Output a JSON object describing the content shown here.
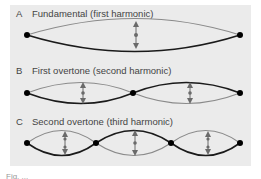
{
  "figure": {
    "panels": [
      {
        "letter": "A",
        "title": "Fundamental (first harmonic)",
        "loops": 1
      },
      {
        "letter": "B",
        "title": "First overtone (second harmonic)",
        "loops": 2
      },
      {
        "letter": "C",
        "title": "Second overtone (third harmonic)",
        "loops": 3
      }
    ],
    "caption_fragment": "Fig. ..."
  },
  "colors": {
    "background": "#ebebeb",
    "string_dark": "#1a1a1a",
    "string_light": "#8a8a8a",
    "arrow": "#6a6a6a",
    "node": "#000000"
  }
}
